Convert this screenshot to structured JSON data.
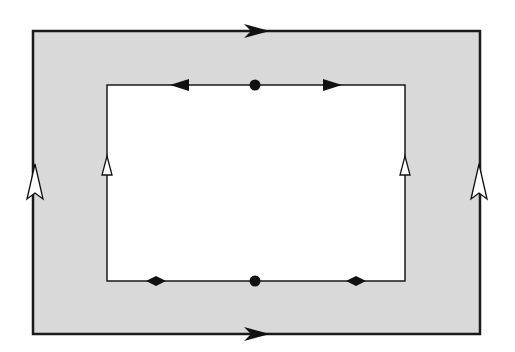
{
  "diagram": {
    "colors": {
      "background": "#ffffff",
      "ring_fill": "#d9d9d9",
      "inner_fill": "#ffffff",
      "stroke": "#1a1a1a",
      "hollow_arrow_fill": "#ffffff"
    },
    "outer_rect": {
      "x": 33,
      "y": 31,
      "width": 447,
      "height": 303,
      "stroke_width": 2.5
    },
    "inner_rect": {
      "x": 107,
      "y": 85,
      "width": 298,
      "height": 196,
      "stroke_width": 1.5
    },
    "markers": [
      {
        "id": "outer-top-arrow",
        "type": "filled-arrow",
        "direction": "right",
        "x": 258,
        "y": 31
      },
      {
        "id": "outer-bottom-arrow",
        "type": "filled-arrow",
        "direction": "right",
        "x": 258,
        "y": 334
      },
      {
        "id": "outer-left-arrow",
        "type": "hollow-arrow",
        "direction": "up",
        "x": 33,
        "y": 180
      },
      {
        "id": "outer-right-arrow",
        "type": "hollow-arrow",
        "direction": "up",
        "x": 480,
        "y": 180
      },
      {
        "id": "inner-top-left-arrow",
        "type": "filled-triangle",
        "direction": "left",
        "x": 180,
        "y": 85
      },
      {
        "id": "inner-top-dot",
        "type": "dot",
        "x": 255,
        "y": 85
      },
      {
        "id": "inner-top-right-arrow",
        "type": "filled-triangle",
        "direction": "right",
        "x": 332,
        "y": 85
      },
      {
        "id": "inner-left-arrow",
        "type": "hollow-triangle",
        "direction": "up",
        "x": 107,
        "y": 167
      },
      {
        "id": "inner-right-arrow",
        "type": "hollow-triangle",
        "direction": "up",
        "x": 405,
        "y": 167
      },
      {
        "id": "inner-bottom-left-diamond",
        "type": "diamond",
        "x": 156,
        "y": 281
      },
      {
        "id": "inner-bottom-dot",
        "type": "dot",
        "x": 255,
        "y": 281
      },
      {
        "id": "inner-bottom-right-diamond",
        "type": "diamond",
        "x": 356,
        "y": 281
      }
    ]
  }
}
